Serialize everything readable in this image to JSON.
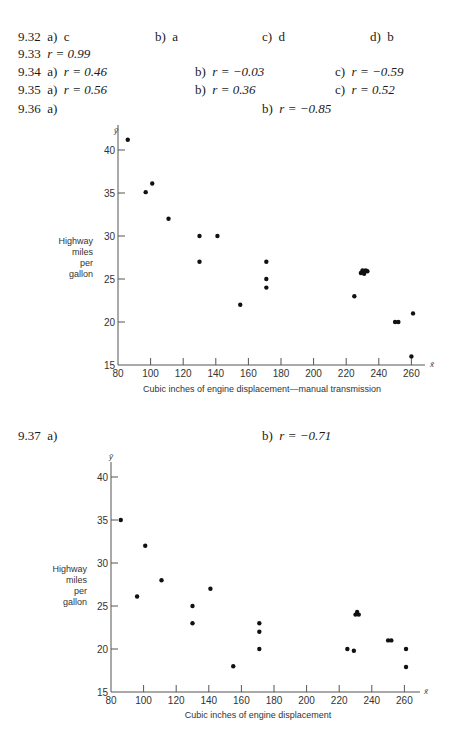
{
  "answers": [
    {
      "num": "9.32",
      "parts": [
        {
          "label": "a)",
          "value": "c"
        },
        {
          "label": "b)",
          "value": "a"
        },
        {
          "label": "c)",
          "value": "d"
        },
        {
          "label": "d)",
          "value": "b"
        }
      ]
    },
    {
      "num": "9.33",
      "parts": [
        {
          "label": "",
          "value": "r = 0.99"
        }
      ]
    },
    {
      "num": "9.34",
      "parts": [
        {
          "label": "a)",
          "value": "r = 0.46"
        },
        {
          "label": "b)",
          "value": "r = −0.03"
        },
        {
          "label": "c)",
          "value": "r = −0.59"
        }
      ]
    },
    {
      "num": "9.35",
      "parts": [
        {
          "label": "a)",
          "value": "r = 0.56"
        },
        {
          "label": "b)",
          "value": "r = 0.36"
        },
        {
          "label": "c)",
          "value": "r = 0.52"
        }
      ]
    },
    {
      "num": "9.36",
      "parts": [
        {
          "label": "a)",
          "value": ""
        },
        {
          "label": "b)",
          "value": "r = −0.85"
        }
      ]
    },
    {
      "num": "9.37",
      "parts": [
        {
          "label": "a)",
          "value": ""
        },
        {
          "label": "b)",
          "value": "r = −0.71"
        }
      ]
    }
  ],
  "chart_data": [
    {
      "type": "scatter",
      "title": "",
      "xlabel": "Cubic inches of engine displacement—manual transmission",
      "ylabel": "Highway miles per gallon",
      "x_axis_symbol": "x̄",
      "y_axis_symbol": "ȳ",
      "xlim": [
        80,
        265
      ],
      "ylim": [
        15,
        42
      ],
      "xticks": [
        80,
        100,
        120,
        140,
        160,
        180,
        200,
        220,
        240,
        260
      ],
      "yticks": [
        15,
        20,
        25,
        30,
        35,
        40
      ],
      "grid": false,
      "points": [
        [
          86,
          41.2
        ],
        [
          97,
          35.1
        ],
        [
          101,
          36.1
        ],
        [
          111,
          32
        ],
        [
          130,
          30
        ],
        [
          130,
          27
        ],
        [
          141,
          30
        ],
        [
          155,
          22
        ],
        [
          171,
          27
        ],
        [
          171,
          25
        ],
        [
          171,
          24
        ],
        [
          225,
          23
        ],
        [
          229,
          25.7
        ],
        [
          230,
          26
        ],
        [
          231,
          25.8
        ],
        [
          231,
          25.6
        ],
        [
          232,
          26
        ],
        [
          233,
          25.9
        ],
        [
          250,
          20
        ],
        [
          252,
          20
        ],
        [
          261,
          21
        ],
        [
          260,
          16
        ]
      ],
      "correlation": "r = −0.85"
    },
    {
      "type": "scatter",
      "title": "",
      "xlabel": "Cubic inches of engine displacement",
      "ylabel": "Highway miles per gallon",
      "x_axis_symbol": "x̄",
      "y_axis_symbol": "ȳ",
      "xlim": [
        80,
        265
      ],
      "ylim": [
        15,
        41
      ],
      "xticks": [
        80,
        100,
        120,
        140,
        160,
        180,
        200,
        220,
        240,
        260
      ],
      "yticks": [
        15,
        20,
        25,
        30,
        35,
        40
      ],
      "grid": false,
      "points": [
        [
          86,
          35
        ],
        [
          96,
          26.1
        ],
        [
          101,
          32
        ],
        [
          111,
          28
        ],
        [
          130,
          25
        ],
        [
          130,
          23
        ],
        [
          141,
          27
        ],
        [
          155,
          18
        ],
        [
          171,
          23
        ],
        [
          171,
          22
        ],
        [
          171,
          20
        ],
        [
          225,
          20
        ],
        [
          229,
          19.8
        ],
        [
          230,
          24
        ],
        [
          231,
          24.3
        ],
        [
          232,
          24
        ],
        [
          250,
          21
        ],
        [
          252,
          21
        ],
        [
          261,
          20
        ],
        [
          261,
          17.9
        ]
      ],
      "correlation": "r = −0.71"
    }
  ]
}
